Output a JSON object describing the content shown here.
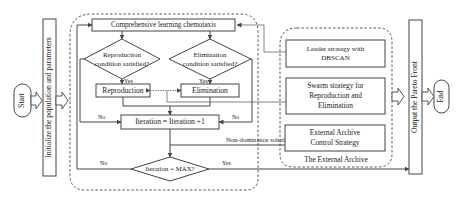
{
  "diagram": {
    "type": "flowchart",
    "nodes": {
      "start": "Start",
      "init": "Initialize the population and parameters",
      "chemotaxis": "Comprehensive learning chemotaxis",
      "repro_cond_line1": "Reproduction",
      "repro_cond_line2": "condition satisfied?",
      "elim_cond_line1": "Elimination",
      "elim_cond_line2": "condition satisfied?",
      "reproduction": "Reproduction",
      "elimination": "Elimination",
      "iteration_inc": "Iteration = Iteration +1",
      "iteration_max": "Iteration = MAX?",
      "leader_line1": "Leader strategy with",
      "leader_line2": "DBSCAN",
      "swarm_line1": "Swarm strategy for",
      "swarm_line2": "Reproduction and",
      "swarm_line3": "Elimination",
      "archive_line1": "External Archive",
      "archive_line2": "Control Strategy",
      "archive_group": "The External Archive",
      "output": "Output the Pareto Front",
      "end": "End"
    },
    "edge_labels": {
      "repro_yes": "Yes",
      "elim_yes": "Yes",
      "repro_no": "No",
      "elim_no": "No",
      "max_no": "No",
      "max_yes": "Yes",
      "non_dominance": "Non-dominance solutions"
    },
    "colors": {
      "stroke": "#444444",
      "background": "#ffffff",
      "text": "#222222"
    }
  }
}
